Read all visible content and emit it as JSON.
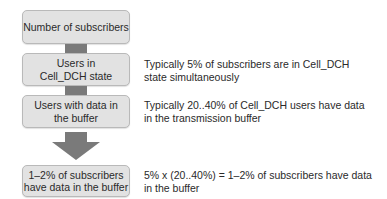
{
  "diagram": {
    "boxes": [
      {
        "label": "Number of subscribers"
      },
      {
        "label": "Users in Cell_DCH state"
      },
      {
        "label": "Users with data in the buffer"
      },
      {
        "label": "1–2% of subscribers have data in the buffer"
      }
    ],
    "descriptions": [
      {
        "text": "Typically 5% of subscribers are in Cell_DCH\nstate simultaneously"
      },
      {
        "text": "Typically 20..40% of Cell_DCH users have data\nin the transmission buffer"
      },
      {
        "text": "5% x (20..40%) = 1–2% of subscribers have data\nin the buffer"
      }
    ],
    "colors": {
      "box_fill": "#e2e2e2",
      "box_border": "#b9b9b9",
      "connector": "#7a7a7a",
      "text": "#2a2a2a"
    }
  }
}
